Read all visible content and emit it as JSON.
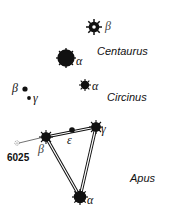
{
  "constellations": [
    {
      "name": "Centaurus"
    },
    {
      "name": "Circinus"
    },
    {
      "name": "Apus"
    }
  ],
  "stars": {
    "cen_beta": {
      "label": "β"
    },
    "cen_alpha": {
      "label": "α"
    },
    "cir_alpha": {
      "label": "α"
    },
    "cir_beta": {
      "label": "β"
    },
    "cir_gamma": {
      "label": "γ"
    },
    "aps_alpha": {
      "label": "α"
    },
    "aps_beta": {
      "label": "β"
    },
    "aps_gamma": {
      "label": "γ"
    },
    "aps_epsilon": {
      "label": "ε"
    }
  },
  "objects": {
    "ngc": {
      "label": "6025"
    }
  },
  "colors": {
    "ink": "#111111",
    "background": "#ffffff"
  }
}
